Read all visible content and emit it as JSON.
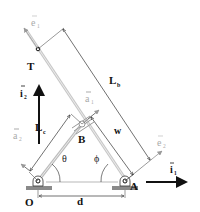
{
  "diagram": {
    "type": "mechanism-schematic",
    "colors": {
      "ink": "#111111",
      "rod": "#bdbdbd",
      "ground": "#8a8a8a",
      "vector_light": "#aaaaaa",
      "dimension": "#333333"
    },
    "points": {
      "O": "O",
      "A": "A",
      "B": "B",
      "T": "T"
    },
    "lengths": {
      "Lb": "L",
      "Lb_sub": "b",
      "Lc": "L",
      "Lc_sub": "c",
      "w": "w",
      "d": "d"
    },
    "angles": {
      "theta": "θ",
      "phi": "ϕ"
    },
    "vectors": {
      "i1": "i",
      "i1_sub": "1",
      "i2": "i",
      "i2_sub": "2",
      "a1": "a",
      "a1_sub": "1",
      "a2": "a",
      "a2_sub": "2",
      "e1": "e",
      "e1_sub": "1",
      "e2": "e",
      "e2_sub": "2"
    }
  }
}
